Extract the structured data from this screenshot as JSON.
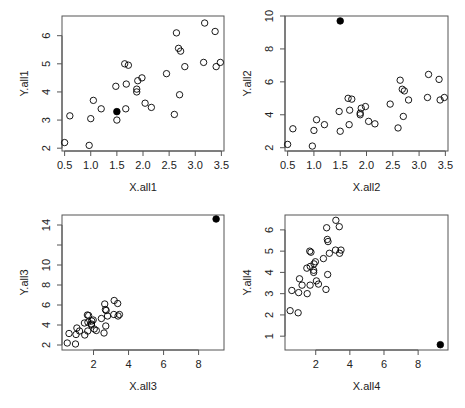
{
  "figure": {
    "width": 465,
    "height": 408,
    "point_color": "#000000",
    "frame_color": "#555555"
  },
  "chart_data": [
    {
      "type": "scatter",
      "title": "",
      "xlabel": "X.all1",
      "ylabel": "Y.all1",
      "xlim": [
        0.45,
        3.55
      ],
      "ylim": [
        1.9,
        6.7
      ],
      "xticks": [
        0.5,
        1.0,
        1.5,
        2.0,
        2.5,
        3.0,
        3.5
      ],
      "xtick_labels": [
        "0.5",
        "1.0",
        "1.5",
        "2.0",
        "2.5",
        "3.0",
        "3.5"
      ],
      "yticks": [
        2,
        3,
        4,
        5,
        6
      ],
      "ytick_labels": [
        "2",
        "3",
        "4",
        "5",
        "6"
      ],
      "grid": false,
      "legend": null,
      "series": [
        {
          "name": "data",
          "marker": "open-circle",
          "x": [
            0.5,
            0.97,
            0.6,
            1.0,
            1.05,
            1.2,
            1.5,
            1.67,
            1.48,
            1.65,
            1.72,
            1.68,
            1.9,
            1.98,
            1.88,
            1.88,
            2.04,
            2.16,
            2.45,
            2.7,
            2.6,
            2.8,
            2.64,
            3.18,
            3.38,
            2.68,
            2.72,
            3.16,
            3.48,
            3.4
          ],
          "y": [
            2.2,
            2.1,
            3.15,
            3.05,
            3.7,
            3.4,
            3.0,
            3.4,
            4.2,
            5.0,
            4.95,
            4.28,
            4.4,
            4.5,
            4.1,
            4.0,
            3.6,
            3.45,
            4.65,
            3.9,
            3.2,
            4.9,
            6.1,
            6.45,
            6.15,
            5.55,
            5.45,
            5.05,
            5.05,
            4.9
          ]
        },
        {
          "name": "highlight",
          "marker": "filled-circle",
          "x": [
            1.5
          ],
          "y": [
            3.3
          ]
        }
      ]
    },
    {
      "type": "scatter",
      "title": "",
      "xlabel": "X.all2",
      "ylabel": "Y.all2",
      "xlim": [
        0.45,
        3.55
      ],
      "ylim": [
        1.8,
        10.0
      ],
      "xticks": [
        0.5,
        1.0,
        1.5,
        2.0,
        2.5,
        3.0,
        3.5
      ],
      "xtick_labels": [
        "0.5",
        "1.0",
        "1.5",
        "2.0",
        "2.5",
        "3.0",
        "3.5"
      ],
      "yticks": [
        2,
        4,
        6,
        8,
        10
      ],
      "ytick_labels": [
        "2",
        "4",
        "6",
        "8",
        "10"
      ],
      "grid": false,
      "legend": null,
      "series": [
        {
          "name": "data",
          "marker": "open-circle",
          "x": [
            0.5,
            0.97,
            0.6,
            1.0,
            1.05,
            1.2,
            1.5,
            1.67,
            1.48,
            1.65,
            1.72,
            1.68,
            1.9,
            1.98,
            1.88,
            1.88,
            2.04,
            2.16,
            2.45,
            2.7,
            2.6,
            2.8,
            2.64,
            3.18,
            3.38,
            2.68,
            2.72,
            3.16,
            3.48,
            3.4
          ],
          "y": [
            2.2,
            2.1,
            3.15,
            3.05,
            3.7,
            3.4,
            3.0,
            3.4,
            4.2,
            5.0,
            4.95,
            4.28,
            4.4,
            4.5,
            4.1,
            4.0,
            3.6,
            3.45,
            4.65,
            3.9,
            3.2,
            4.9,
            6.1,
            6.45,
            6.15,
            5.55,
            5.45,
            5.05,
            5.05,
            4.9
          ]
        },
        {
          "name": "outlier",
          "marker": "filled-circle",
          "x": [
            1.5
          ],
          "y": [
            9.7
          ]
        }
      ]
    },
    {
      "type": "scatter",
      "title": "",
      "xlabel": "X.all3",
      "ylabel": "Y.all3",
      "xlim": [
        0.2,
        9.45
      ],
      "ylim": [
        1.5,
        15.0
      ],
      "xticks": [
        2,
        4,
        6,
        8
      ],
      "xtick_labels": [
        "2",
        "4",
        "6",
        "8"
      ],
      "yticks": [
        2,
        4,
        6,
        8,
        10,
        12,
        14
      ],
      "ytick_labels": [
        "2",
        "4",
        "6",
        "8",
        "10",
        "",
        "14"
      ],
      "grid": false,
      "legend": null,
      "series": [
        {
          "name": "data",
          "marker": "open-circle",
          "x": [
            0.5,
            0.97,
            0.6,
            1.0,
            1.05,
            1.2,
            1.5,
            1.67,
            1.48,
            1.65,
            1.72,
            1.68,
            1.9,
            1.98,
            1.88,
            1.88,
            2.04,
            2.16,
            2.45,
            2.7,
            2.6,
            2.8,
            2.64,
            3.18,
            3.38,
            2.68,
            2.72,
            3.16,
            3.48,
            3.4
          ],
          "y": [
            2.2,
            2.1,
            3.15,
            3.05,
            3.7,
            3.4,
            3.0,
            3.4,
            4.2,
            5.0,
            4.95,
            4.28,
            4.4,
            4.5,
            4.1,
            4.0,
            3.6,
            3.45,
            4.65,
            3.9,
            3.2,
            4.9,
            6.1,
            6.45,
            6.15,
            5.55,
            5.45,
            5.05,
            5.05,
            4.9
          ]
        },
        {
          "name": "outlier",
          "marker": "filled-circle",
          "x": [
            9.0
          ],
          "y": [
            14.6
          ]
        }
      ]
    },
    {
      "type": "scatter",
      "title": "",
      "xlabel": "X.all4",
      "ylabel": "Y.all4",
      "xlim": [
        0.2,
        9.75
      ],
      "ylim": [
        0.35,
        6.7
      ],
      "xticks": [
        2,
        4,
        6,
        8
      ],
      "xtick_labels": [
        "2",
        "4",
        "6",
        "8"
      ],
      "yticks": [
        1,
        2,
        3,
        4,
        5,
        6
      ],
      "ytick_labels": [
        "1",
        "2",
        "3",
        "4",
        "5",
        "6"
      ],
      "grid": false,
      "legend": null,
      "series": [
        {
          "name": "data",
          "marker": "open-circle",
          "x": [
            0.5,
            0.97,
            0.6,
            1.0,
            1.05,
            1.2,
            1.5,
            1.67,
            1.48,
            1.65,
            1.72,
            1.68,
            1.9,
            1.98,
            1.88,
            1.88,
            2.04,
            2.16,
            2.45,
            2.7,
            2.6,
            2.8,
            2.64,
            3.18,
            3.38,
            2.68,
            2.72,
            3.16,
            3.48,
            3.4
          ],
          "y": [
            2.2,
            2.1,
            3.15,
            3.05,
            3.7,
            3.4,
            3.0,
            3.4,
            4.2,
            5.0,
            4.95,
            4.28,
            4.4,
            4.5,
            4.1,
            4.0,
            3.6,
            3.45,
            4.65,
            3.9,
            3.2,
            4.9,
            6.1,
            6.45,
            6.15,
            5.55,
            5.45,
            5.05,
            5.05,
            4.9
          ]
        },
        {
          "name": "outlier",
          "marker": "filled-circle",
          "x": [
            9.3
          ],
          "y": [
            0.6
          ]
        }
      ]
    }
  ],
  "layout": {
    "panels": [
      {
        "frame": [
          62,
          16,
          224,
          151
        ]
      },
      {
        "frame": [
          285,
          16,
          448,
          151
        ]
      },
      {
        "frame": [
          62,
          215,
          224,
          350
        ]
      },
      {
        "frame": [
          285,
          215,
          448,
          350
        ]
      }
    ]
  }
}
